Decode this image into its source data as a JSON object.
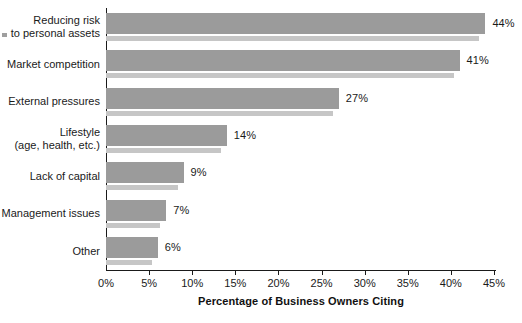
{
  "chart_data": {
    "type": "bar",
    "orientation": "horizontal",
    "title": "",
    "xlabel": "Percentage of Business Owners Citing",
    "ylabel": "",
    "categories": [
      "Reducing risk\nto personal assets",
      "Market competition",
      "External pressures",
      "Lifestyle\n(age, health, etc.)",
      "Lack of capital",
      "Management issues",
      "Other"
    ],
    "values": [
      44,
      41,
      27,
      14,
      9,
      7,
      6
    ],
    "value_labels": [
      "44%",
      "41%",
      "27%",
      "14%",
      "9%",
      "7%",
      "6%"
    ],
    "xlim": [
      0,
      45
    ],
    "xticks": [
      0,
      5,
      10,
      15,
      20,
      25,
      30,
      35,
      40,
      45
    ],
    "xtick_labels": [
      "0%",
      "5%",
      "10%",
      "15%",
      "20%",
      "25%",
      "30%",
      "35%",
      "40%",
      "45%"
    ],
    "grid": false,
    "legend": null,
    "bar_color": "#9b9b9b",
    "bar_shadow_color": "#c6c6c6",
    "axis_color": "#1a1a1a",
    "text_color": "#1a1a1a",
    "background": "#ffffff"
  }
}
